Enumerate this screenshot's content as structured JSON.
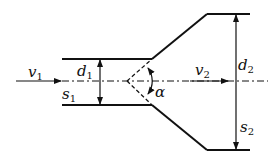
{
  "diagram": {
    "type": "sudden-divergence pipe expansion (diffuser)",
    "labels": {
      "v1": {
        "main": "v",
        "sub": "1"
      },
      "d1": {
        "main": "d",
        "sub": "1"
      },
      "s1": {
        "main": "s",
        "sub": "1"
      },
      "v2": {
        "main": "v",
        "sub": "2"
      },
      "d2": {
        "main": "d",
        "sub": "2"
      },
      "s2": {
        "main": "s",
        "sub": "2"
      },
      "alpha": "α"
    },
    "colors": {
      "stroke": "#111111",
      "background": "#ffffff"
    }
  }
}
